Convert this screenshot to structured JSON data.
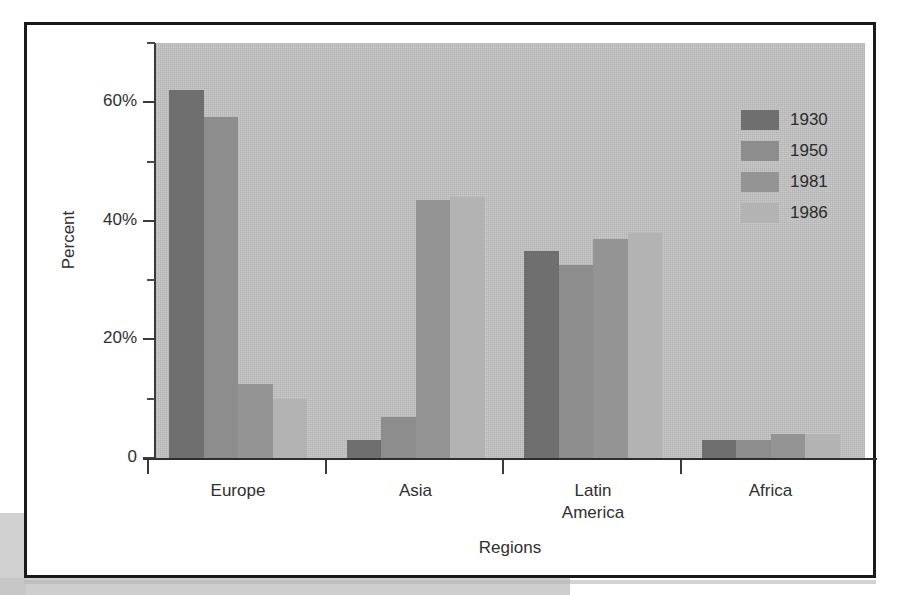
{
  "chart_data": {
    "type": "bar",
    "title": "",
    "subtitle": "",
    "xlabel": "Regions",
    "ylabel": "Percent",
    "categories": [
      "Europe",
      "Asia",
      "Latin America",
      "Africa"
    ],
    "category_lines": [
      [
        "Europe"
      ],
      [
        "Asia"
      ],
      [
        "Latin",
        "America"
      ],
      [
        "Africa"
      ]
    ],
    "series": [
      {
        "name": "1930",
        "color": "#6f6f6f",
        "values": [
          62,
          3,
          35,
          3
        ]
      },
      {
        "name": "1950",
        "color": "#8d8d8d",
        "values": [
          57.5,
          7,
          32.5,
          3
        ]
      },
      {
        "name": "1981",
        "color": "#949494",
        "values": [
          12.5,
          43.5,
          37,
          4
        ]
      },
      {
        "name": "1986",
        "color": "#b3b3b3",
        "values": [
          10,
          44,
          38,
          4
        ]
      }
    ],
    "ylim": [
      0,
      70
    ],
    "y_ticks_major": [
      0,
      20,
      40,
      60
    ],
    "y_tick_labels": [
      "0",
      "20%",
      "40%",
      "60%"
    ],
    "y_ticks_minor": [
      10,
      30,
      50,
      70
    ],
    "grid": false,
    "legend_position": "top-right",
    "plot_background": "#c2c2c2",
    "figure_background": "#ffffff",
    "axis_color": "#3a3a3a"
  },
  "legend": {
    "entries": [
      {
        "label": "1930"
      },
      {
        "label": "1950"
      },
      {
        "label": "1981"
      },
      {
        "label": "1986"
      }
    ]
  },
  "axes": {
    "y_title": "Percent",
    "x_title": "Regions",
    "y_labels": [
      "60%",
      "40%",
      "20%",
      "0"
    ]
  }
}
